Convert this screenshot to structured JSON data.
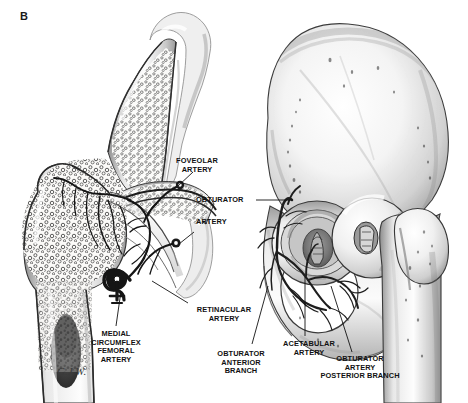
{
  "figure": {
    "panel_letter": "B",
    "signature": "G.J.W.",
    "background_color": "#ffffff",
    "ink_color": "#1a1a1a",
    "caption_style": "grayscale pen-and-ink medical illustration"
  },
  "annotations": [
    {
      "id": "foveolar-artery",
      "label": "FOVEOLAR\nARTERY",
      "x": 196,
      "y": 157,
      "align": "center",
      "leader": [
        [
          193,
          172
        ],
        [
          178,
          186
        ]
      ]
    },
    {
      "id": "obturator-artery-upper",
      "label": "OBTURATOR",
      "x": 196,
      "y": 196,
      "align": "left",
      "leader": [
        [
          256,
          200
        ],
        [
          292,
          200
        ]
      ]
    },
    {
      "id": "obturator-artery-lower",
      "label": "ARTERY",
      "x": 196,
      "y": 218,
      "align": "left",
      "leader": [
        [
          194,
          232
        ],
        [
          178,
          244
        ]
      ]
    },
    {
      "id": "retinacular-artery",
      "label": "RETINACULAR\nARTERY",
      "x": 190,
      "y": 306,
      "align": "center",
      "leader": [
        [
          188,
          305
        ],
        [
          150,
          281
        ]
      ]
    },
    {
      "id": "medial-circumflex-femoral-artery",
      "label": "MEDIAL\nCIRCUMFLEX\nFEMORAL\nARTERY",
      "x": 88,
      "y": 330,
      "align": "center",
      "leader": [
        [
          115,
          328
        ],
        [
          121,
          291
        ]
      ]
    },
    {
      "id": "obturator-anterior-branch",
      "label": "OBTURATOR\nANTERIOR\nBRANCH",
      "x": 210,
      "y": 350,
      "align": "center",
      "leader": [
        [
          252,
          348
        ],
        [
          268,
          286
        ]
      ]
    },
    {
      "id": "acetabular-artery",
      "label": "ACETABULAR\nARTERY",
      "x": 282,
      "y": 343,
      "align": "center",
      "leader": [
        [
          305,
          341
        ],
        [
          305,
          276
        ]
      ]
    },
    {
      "id": "obturator-artery-posterior-branch",
      "label": "OBTURATOR\nARTERY\nPOSTERIOR BRANCH",
      "x": 308,
      "y": 358,
      "align": "center",
      "leader": [
        [
          352,
          356
        ],
        [
          330,
          285
        ]
      ]
    }
  ],
  "structures": {
    "left_figure": {
      "name": "coronal-section-proximal-femur-and-acetabulum",
      "parts": [
        "iliac-bone-section",
        "acetabular-roof",
        "femoral-head",
        "femoral-neck",
        "greater-trochanter",
        "femoral-shaft",
        "trabecular-bone",
        "medullary-cavity",
        "joint-capsule",
        "retinacular-vessels",
        "foveolar-artery-vessel",
        "medial-circumflex-femoral-vessel"
      ]
    },
    "right_figure": {
      "name": "lateral-view-hemipelvis-with-dislocated-femoral-head",
      "parts": [
        "ilium-wing",
        "iliac-crest",
        "acetabulum",
        "acetabular-fossa",
        "ligamentum-teres",
        "femoral-head",
        "femoral-neck",
        "greater-trochanter",
        "ischium",
        "pubis",
        "obturator-foramen",
        "obturator-artery-vessel",
        "acetabular-artery-vessel",
        "nutrient-foramina"
      ]
    }
  }
}
